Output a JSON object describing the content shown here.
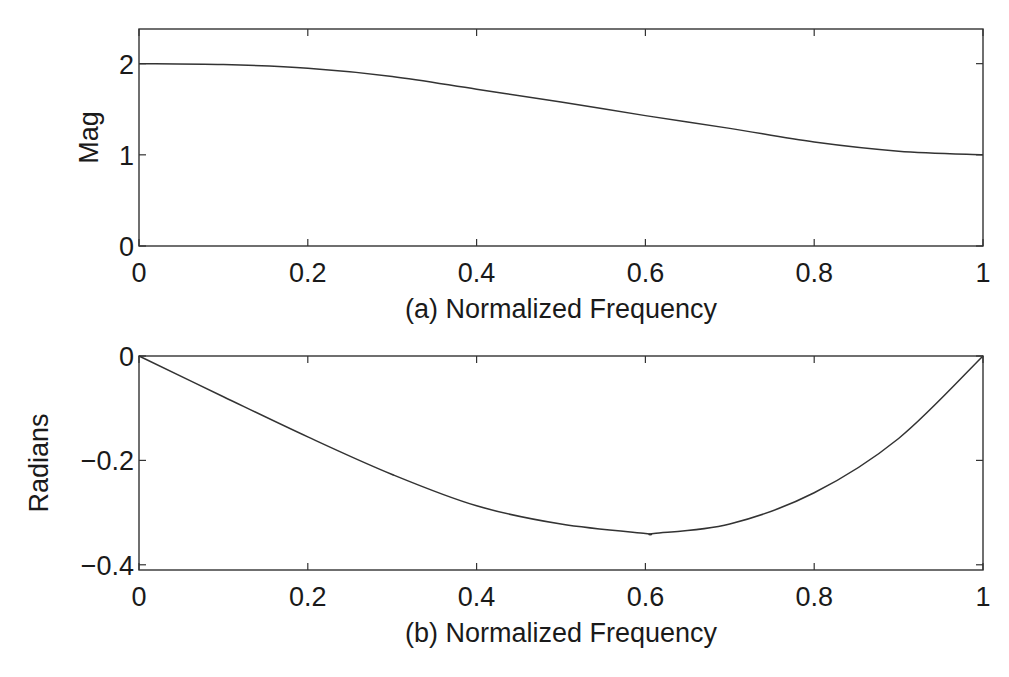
{
  "chart_data": [
    {
      "type": "line",
      "panel": "a",
      "title": "",
      "xlabel": "(a) Normalized Frequency",
      "ylabel": "Mag",
      "xlim": [
        0,
        1
      ],
      "ylim": [
        0,
        2.38
      ],
      "x_ticks": [
        "0",
        "0.2",
        "0.4",
        "0.6",
        "0.8",
        "1"
      ],
      "y_ticks": [
        "0",
        "1",
        "2"
      ],
      "grid": false,
      "series": [
        {
          "name": "Magnitude",
          "x": [
            0,
            0.1,
            0.2,
            0.3,
            0.4,
            0.5,
            0.6,
            0.7,
            0.8,
            0.9,
            1.0
          ],
          "values": [
            2.0,
            1.99,
            1.95,
            1.86,
            1.72,
            1.58,
            1.43,
            1.29,
            1.14,
            1.04,
            1.0
          ]
        }
      ]
    },
    {
      "type": "line",
      "panel": "b",
      "title": "",
      "xlabel": "(b) Normalized Frequency",
      "ylabel": "Radians",
      "xlim": [
        0,
        1
      ],
      "ylim": [
        -0.41,
        0
      ],
      "x_ticks": [
        "0",
        "0.2",
        "0.4",
        "0.6",
        "0.8",
        "1"
      ],
      "y_ticks": [
        "0",
        "−0.2",
        "−0.4"
      ],
      "grid": false,
      "series": [
        {
          "name": "Phase",
          "x": [
            0,
            0.1,
            0.2,
            0.3,
            0.4,
            0.5,
            0.6,
            0.61,
            0.7,
            0.8,
            0.9,
            1.0
          ],
          "values": [
            0,
            -0.078,
            -0.155,
            -0.227,
            -0.287,
            -0.322,
            -0.34,
            -0.34,
            -0.322,
            -0.262,
            -0.158,
            0
          ]
        }
      ]
    }
  ]
}
